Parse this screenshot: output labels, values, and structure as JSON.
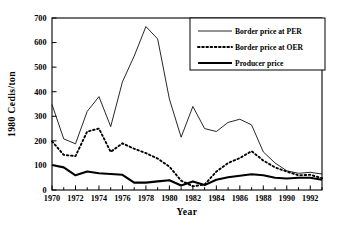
{
  "chart_data": {
    "type": "line",
    "title": "",
    "xlabel": "Year",
    "ylabel": "1980 Cedis/ton",
    "xlim": [
      1970,
      1993
    ],
    "ylim": [
      0,
      700
    ],
    "ytick_step": 100,
    "xtick_step": 2,
    "minor_xticks": true,
    "grid": false,
    "legend_position": "top-right",
    "xticklabels": [
      "1970",
      "1972",
      "1974",
      "1976",
      "1978",
      "1980",
      "1982",
      "1984",
      "1986",
      "1988",
      "1990",
      "1992"
    ],
    "yticklabels": [
      "0",
      "100",
      "200",
      "300",
      "400",
      "500",
      "600",
      "700"
    ],
    "x": [
      1970,
      1971,
      1972,
      1973,
      1974,
      1975,
      1976,
      1977,
      1978,
      1979,
      1980,
      1981,
      1982,
      1983,
      1984,
      1985,
      1986,
      1987,
      1988,
      1989,
      1990,
      1991,
      1992,
      1993
    ],
    "series": [
      {
        "name": "Border price at PER",
        "style": "thin-solid",
        "color": "#000000",
        "values": [
          348,
          208,
          188,
          320,
          380,
          258,
          440,
          545,
          665,
          615,
          370,
          215,
          340,
          250,
          238,
          275,
          288,
          265,
          155,
          110,
          78,
          68,
          72,
          65
        ]
      },
      {
        "name": "Border price at OER",
        "style": "dotted",
        "color": "#000000",
        "values": [
          198,
          143,
          138,
          238,
          250,
          155,
          190,
          168,
          150,
          128,
          95,
          38,
          15,
          22,
          75,
          110,
          130,
          158,
          120,
          92,
          75,
          60,
          62,
          48
        ]
      },
      {
        "name": "Producer price",
        "style": "thick-solid",
        "color": "#000000",
        "values": [
          102,
          92,
          60,
          75,
          68,
          65,
          62,
          30,
          30,
          35,
          40,
          18,
          35,
          20,
          42,
          52,
          58,
          64,
          60,
          50,
          47,
          50,
          50,
          42
        ]
      }
    ]
  },
  "legend": {
    "items": [
      {
        "label": "Border price at PER",
        "style": "thin-solid"
      },
      {
        "label": "Border price at OER",
        "style": "dotted"
      },
      {
        "label": "Producer price",
        "style": "thick-solid"
      }
    ]
  },
  "axes": {
    "x_title": "Year",
    "y_title": "1980 Cedis/ton"
  }
}
